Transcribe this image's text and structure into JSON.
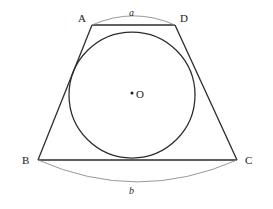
{
  "figure": {
    "shape_type": "geometry-diagram",
    "vertices": [
      {
        "name": "A",
        "label": "A",
        "x": 92,
        "y": 25,
        "label_x": 78,
        "label_y": 13
      },
      {
        "name": "D",
        "label": "D",
        "x": 175,
        "y": 25,
        "label_x": 180,
        "label_y": 13
      },
      {
        "name": "B",
        "label": "B",
        "x": 38,
        "y": 160,
        "label_x": 22,
        "label_y": 155
      },
      {
        "name": "C",
        "label": "C",
        "x": 237,
        "y": 160,
        "label_x": 245,
        "label_y": 155
      }
    ],
    "center": {
      "name": "O",
      "label": "O",
      "x": 132,
      "y": 94,
      "dot_x": 132,
      "dot_y": 93,
      "label_x": 136,
      "label_y": 89
    },
    "circle": {
      "cx": 132,
      "cy": 95,
      "r": 63
    },
    "segments": [
      {
        "name": "side-AD",
        "from": "A",
        "to": "D"
      },
      {
        "name": "side-AB",
        "from": "A",
        "to": "B"
      },
      {
        "name": "side-BC",
        "from": "B",
        "to": "C"
      },
      {
        "name": "side-CD",
        "from": "C",
        "to": "D"
      }
    ],
    "arcs": [
      {
        "name": "arc-a",
        "label": "a",
        "endpoints": [
          "A",
          "D"
        ],
        "side": "above",
        "label_x": 129,
        "label_y": 8
      },
      {
        "name": "arc-b",
        "label": "b",
        "endpoints": [
          "B",
          "C"
        ],
        "side": "below",
        "label_x": 129,
        "label_y": 186
      }
    ],
    "colors": {
      "background": "#ffffff",
      "stroke": "#2b2b2b",
      "arc_stroke": "#8c8c8c",
      "label_text": "#1a1a1a",
      "arc_label_text": "#2a2a2a"
    }
  }
}
